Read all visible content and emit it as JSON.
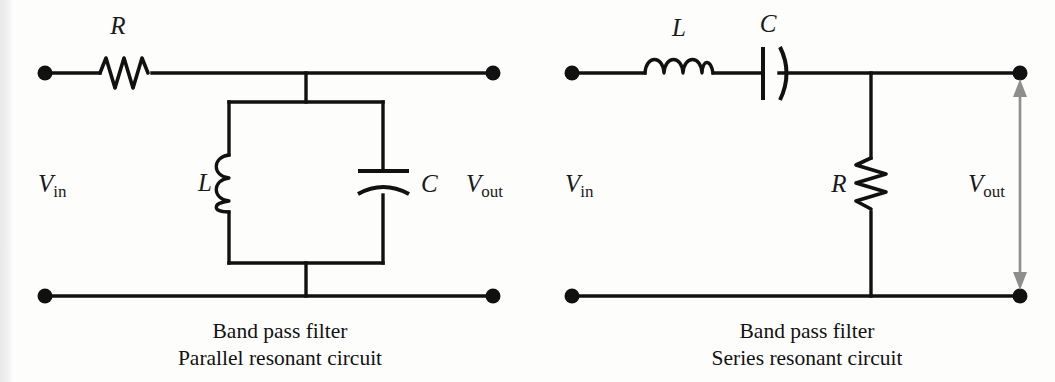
{
  "figure": {
    "background_color": "#fdfdfc",
    "ink_color": "#111111",
    "arrow_color": "#8e8e8e"
  },
  "circuits": [
    {
      "id": "parallel-resonant",
      "caption_line1": "Band pass filter",
      "caption_line2": "Parallel resonant circuit",
      "input_label_v": "V",
      "input_label_sub": "in",
      "output_label_v": "V",
      "output_label_sub": "out",
      "components": [
        {
          "name": "resistor",
          "symbol": "R",
          "orientation": "horizontal",
          "position": "series-top"
        },
        {
          "name": "inductor",
          "symbol": "L",
          "orientation": "vertical",
          "position": "shunt-left-branch"
        },
        {
          "name": "capacitor",
          "symbol": "C",
          "orientation": "horizontal-plates",
          "position": "shunt-right-branch"
        }
      ],
      "topology": "R in series; L and C in parallel to ground"
    },
    {
      "id": "series-resonant",
      "caption_line1": "Band pass filter",
      "caption_line2": "Series resonant circuit",
      "input_label_v": "V",
      "input_label_sub": "in",
      "output_label_v": "V",
      "output_label_sub": "out",
      "components": [
        {
          "name": "inductor",
          "symbol": "L",
          "orientation": "horizontal",
          "position": "series-top-first"
        },
        {
          "name": "capacitor",
          "symbol": "C",
          "orientation": "vertical-plates",
          "position": "series-top-second"
        },
        {
          "name": "resistor",
          "symbol": "R",
          "orientation": "vertical",
          "position": "shunt-to-ground"
        }
      ],
      "topology": "L and C in series; R shunt to ground",
      "output_arrow": "double-headed-vertical"
    }
  ]
}
